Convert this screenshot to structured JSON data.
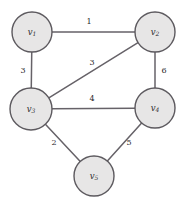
{
  "figure": {
    "background_color": "#ffffff",
    "node_fill_color": "#e7e6e6",
    "node_stroke_color": "#5d5a5f",
    "edge_color": "#666268",
    "text_color": "#2b292c"
  },
  "chart_data": {
    "type": "diagram",
    "title": "",
    "graph_type": "weighted undirected graph",
    "nodes": [
      {
        "id": "v1",
        "base": "v",
        "sub": "1",
        "x": 32,
        "y": 32,
        "r": 20
      },
      {
        "id": "v2",
        "base": "v",
        "sub": "2",
        "x": 155,
        "y": 32,
        "r": 20
      },
      {
        "id": "v3",
        "base": "v",
        "sub": "3",
        "x": 31,
        "y": 109,
        "r": 21
      },
      {
        "id": "v4",
        "base": "v",
        "sub": "4",
        "x": 155,
        "y": 108,
        "r": 20
      },
      {
        "id": "v5",
        "base": "v",
        "sub": "5",
        "x": 94,
        "y": 176,
        "r": 20
      }
    ],
    "edges": [
      {
        "source": "v1",
        "target": "v2",
        "weight": "1",
        "lx": 89,
        "ly": 22
      },
      {
        "source": "v1",
        "target": "v3",
        "weight": "3",
        "lx": 23,
        "ly": 71
      },
      {
        "source": "v3",
        "target": "v2",
        "weight": "3",
        "lx": 92,
        "ly": 63
      },
      {
        "source": "v2",
        "target": "v4",
        "weight": "6",
        "lx": 164,
        "ly": 71
      },
      {
        "source": "v3",
        "target": "v4",
        "weight": "4",
        "lx": 92,
        "ly": 99
      },
      {
        "source": "v3",
        "target": "v5",
        "weight": "2",
        "lx": 54,
        "ly": 143
      },
      {
        "source": "v4",
        "target": "v5",
        "weight": "5",
        "lx": 129,
        "ly": 143
      }
    ]
  }
}
